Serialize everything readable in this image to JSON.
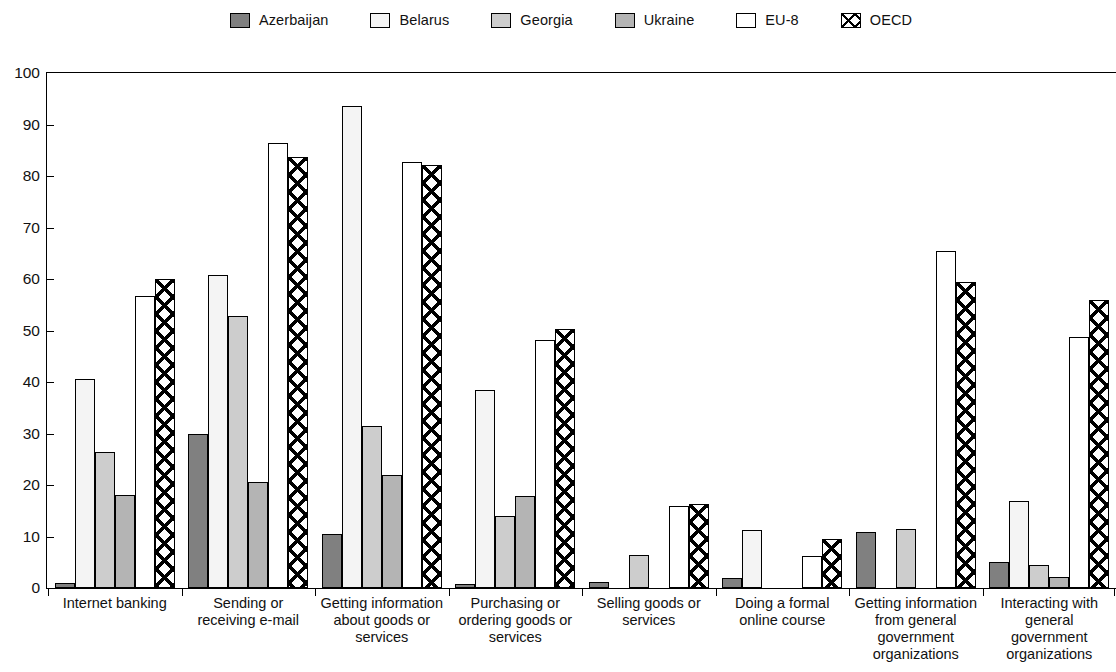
{
  "chart_data": {
    "type": "bar",
    "title": "",
    "subtitle": "",
    "xlabel": "",
    "ylabel": "",
    "ylim": [
      0,
      100
    ],
    "yticks": [
      0,
      10,
      20,
      30,
      40,
      50,
      60,
      70,
      80,
      90,
      100
    ],
    "grid": false,
    "legend_position": "top",
    "categories": [
      "Internet banking",
      "Sending or receiving e-mail",
      "Getting information about goods or services",
      "Purchasing or ordering goods or services",
      "Selling goods or services",
      "Doing a formal online course",
      "Getting information from general government organizations",
      "Interacting with general government organizations"
    ],
    "category_label_lines": [
      [
        "Internet banking"
      ],
      [
        "Sending or",
        "receiving e-mail"
      ],
      [
        "Getting information",
        "about goods or",
        "services"
      ],
      [
        "Purchasing or",
        "ordering goods or",
        "services"
      ],
      [
        "Selling goods or",
        "services"
      ],
      [
        "Doing a formal",
        "online course"
      ],
      [
        "Getting information",
        "from general",
        "government",
        "organizations"
      ],
      [
        "Interacting with",
        "general",
        "government",
        "organizations"
      ]
    ],
    "series": [
      {
        "name": "Azerbaijan",
        "key": "azerbaijan",
        "color": "#808080",
        "pattern": "solid",
        "values": [
          1.0,
          29.9,
          10.4,
          0.8,
          1.2,
          1.9,
          10.8,
          5.0
        ]
      },
      {
        "name": "Belarus",
        "key": "belarus",
        "color": "#f4f4f4",
        "pattern": "solid",
        "values": [
          40.6,
          60.7,
          93.5,
          38.4,
          0,
          11.2,
          0,
          16.8
        ]
      },
      {
        "name": "Georgia",
        "key": "georgia",
        "color": "#cdcdcd",
        "pattern": "solid",
        "values": [
          26.4,
          52.8,
          31.5,
          14.0,
          6.5,
          0,
          11.5,
          4.5
        ]
      },
      {
        "name": "Ukraine",
        "key": "ukraine",
        "color": "#b4b4b4",
        "pattern": "solid",
        "values": [
          18.0,
          20.5,
          21.9,
          17.8,
          0,
          0,
          0,
          2.2
        ]
      },
      {
        "name": "EU-8",
        "key": "eu8",
        "color": "#ffffff",
        "pattern": "solid",
        "values": [
          56.7,
          86.4,
          82.8,
          48.1,
          15.9,
          6.2,
          65.4,
          48.7
        ]
      },
      {
        "name": "OECD",
        "key": "oecd",
        "color": "#ffffff",
        "pattern": "crosshatch",
        "values": [
          60.1,
          83.6,
          82.1,
          50.3,
          16.3,
          9.5,
          59.4,
          56.0
        ]
      }
    ]
  },
  "legend": {
    "items": [
      {
        "label": "Azerbaijan",
        "key": "azerbaijan"
      },
      {
        "label": "Belarus",
        "key": "belarus"
      },
      {
        "label": "Georgia",
        "key": "georgia"
      },
      {
        "label": "Ukraine",
        "key": "ukraine"
      },
      {
        "label": "EU-8",
        "key": "eu8"
      },
      {
        "label": "OECD",
        "key": "oecd"
      }
    ]
  }
}
